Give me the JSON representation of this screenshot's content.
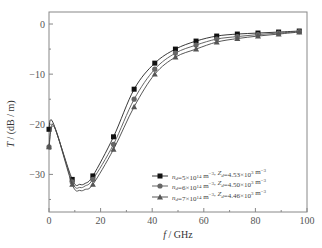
{
  "chart_data": {
    "type": "line",
    "title": "",
    "xlabel": "f / GHz",
    "ylabel": "T / (dB/m)",
    "xlim": [
      0,
      100
    ],
    "ylim": [
      -37.5,
      2.4
    ],
    "xticks": [
      0,
      20,
      40,
      60,
      80,
      100
    ],
    "yticks": [
      0,
      -10,
      -20,
      -30
    ],
    "grid": false,
    "legend_position": "lower right",
    "x": [
      0,
      9,
      17,
      25,
      33,
      41,
      49,
      57,
      65,
      73,
      81,
      89,
      97
    ],
    "series": [
      {
        "name": "n_d=5×10^14 m^-3, Z_d=4.53×10^3 m^-3",
        "marker": "square",
        "values": [
          -21.0,
          -31.0,
          -30.3,
          -22.5,
          -13.0,
          -7.8,
          -5.0,
          -3.4,
          -2.4,
          -2.0,
          -1.8,
          -1.6,
          -1.4
        ]
      },
      {
        "name": "n_d=6×10^14 m^-3, Z_d=4.50×10^3 m^-3",
        "marker": "circle",
        "values": [
          -24.5,
          -31.5,
          -31.0,
          -24.0,
          -15.0,
          -9.0,
          -5.8,
          -4.2,
          -3.0,
          -2.5,
          -2.1,
          -1.8,
          -1.5
        ]
      },
      {
        "name": "n_d=7×10^14 m^-3, Z_d=4.46×10^3 m^-3",
        "marker": "triangle",
        "values": [
          -24.5,
          -32.0,
          -32.0,
          -25.0,
          -16.5,
          -10.0,
          -6.6,
          -5.0,
          -3.6,
          -2.9,
          -2.4,
          -2.0,
          -1.6
        ]
      }
    ]
  },
  "labels": {
    "x_axis_symbol": "f",
    "x_axis_unit": " / GHz",
    "y_axis_symbol": "T",
    "y_axis_unit": " / (dB / m)"
  },
  "legend": [
    {
      "nd": "5×10",
      "nd_exp": "14",
      "zd": "4.53×10",
      "zd_exp": "3"
    },
    {
      "nd": "6×10",
      "nd_exp": "14",
      "zd": "4.50×10",
      "zd_exp": "3"
    },
    {
      "nd": "7×10",
      "nd_exp": "14",
      "zd": "4.46×10",
      "zd_exp": "3"
    }
  ]
}
